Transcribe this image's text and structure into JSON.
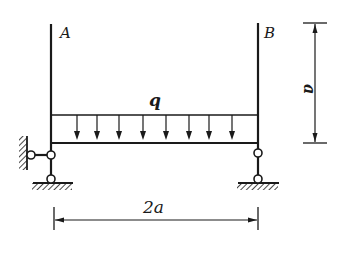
{
  "diagram": {
    "type": "structural-frame",
    "labels": {
      "point_a": "A",
      "point_b": "B",
      "load": "q",
      "height_dim": "a",
      "span_dim": "2a"
    },
    "load": {
      "kind": "uniformly-distributed",
      "symbol": "q",
      "arrow_count": 8,
      "direction": "down"
    },
    "supports": {
      "left": "hinge at ground with horizontal link to wall",
      "right": "two-force link (hinged bar) to ground"
    },
    "dimensions": {
      "vertical": "a",
      "horizontal": "2a"
    },
    "colors": {
      "line": "#1a1a1a",
      "background": "#ffffff"
    }
  }
}
